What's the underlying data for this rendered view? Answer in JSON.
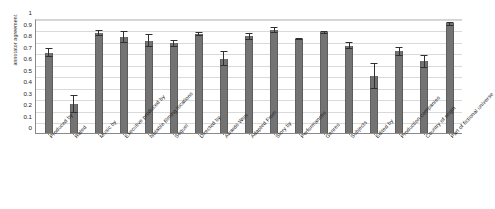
{
  "chart_data": {
    "type": "bar",
    "title": "",
    "xlabel": "",
    "ylabel": "annotator agreement",
    "ylim": [
      0,
      1
    ],
    "ytick_labels": [
      "1",
      "0.9",
      "0.8",
      "0.7",
      "0.6",
      "0.5",
      "0.4",
      "0.3",
      "0.2",
      "0.1",
      "0"
    ],
    "ytick_values": [
      1,
      0.9,
      0.8,
      0.7,
      0.6,
      0.5,
      0.4,
      0.3,
      0.2,
      0.1,
      0
    ],
    "grid": true,
    "legend": "none",
    "orientation": "vertical",
    "error_bars": true,
    "bar_color": "#6e6e6e",
    "error_color": "#303030",
    "grid_color": "#d9d9d9",
    "axis_color": "#8a8a8a",
    "categories": [
      "Produced by",
      "Rated",
      "Music by",
      "Executive produced by",
      "Notable filming locations",
      "Sequel",
      "Directed by",
      "Awards Won",
      "Adapted From",
      "Story by",
      "Performances",
      "Genres",
      "Subjects",
      "Edited by",
      "Production companies",
      "Country of origin",
      "Part of fictional universe"
    ],
    "values": [
      0.695,
      0.25,
      0.865,
      0.83,
      0.8,
      0.775,
      0.855,
      0.635,
      0.835,
      0.89,
      0.815,
      0.87,
      0.755,
      0.495,
      0.705,
      0.62,
      0.95
    ],
    "error_low": [
      0.655,
      0.17,
      0.835,
      0.775,
      0.745,
      0.745,
      0.84,
      0.575,
      0.805,
      0.865,
      0.805,
      0.855,
      0.725,
      0.38,
      0.665,
      0.565,
      0.93
    ],
    "error_high": [
      0.735,
      0.33,
      0.895,
      0.885,
      0.855,
      0.805,
      0.875,
      0.705,
      0.865,
      0.915,
      0.825,
      0.885,
      0.785,
      0.605,
      0.745,
      0.675,
      0.965
    ]
  }
}
